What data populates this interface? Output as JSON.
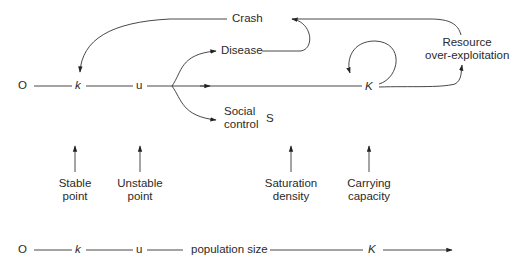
{
  "diagram": {
    "main_axis": {
      "origin": "O",
      "stable_point": "k",
      "unstable_point": "u",
      "carrying_capacity": "K",
      "saturation": "S"
    },
    "outcomes": {
      "crash": "Crash",
      "disease": "Disease",
      "social_control_line1": "Social",
      "social_control_line2": "control",
      "resource_line1": "Resource",
      "resource_line2": "over-exploitation"
    },
    "point_labels": [
      {
        "line1": "Stable",
        "line2": "point"
      },
      {
        "line1": "Unstable",
        "line2": "point"
      },
      {
        "line1": "Saturation",
        "line2": "density"
      },
      {
        "line1": "Carrying",
        "line2": "capacity"
      }
    ],
    "bottom_axis": {
      "origin": "O",
      "k": "k",
      "u": "u",
      "label": "population size",
      "K": "K"
    }
  }
}
